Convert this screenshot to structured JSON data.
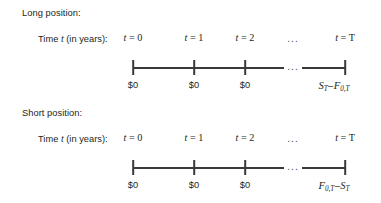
{
  "figure": {
    "background": "#ffffff",
    "ink_color": "#231f20",
    "rule_color": "#3a3a3a"
  },
  "blocks": [
    {
      "heading": "Long position:",
      "axis_label": "Time t (in years):",
      "axis_label_plain_prefix": "Time ",
      "axis_label_italic": "t",
      "axis_label_plain_suffix": " (in years):",
      "time_ticks": [
        {
          "var": "t",
          "eq": " = 0",
          "x": 133
        },
        {
          "var": "t",
          "eq": " = 1",
          "x": 194
        },
        {
          "var": "t",
          "eq": " = 2",
          "x": 245
        },
        {
          "var": "t",
          "eq": " = T",
          "x": 345
        }
      ],
      "time_ellipsis": {
        "text": "...",
        "x": 293
      },
      "axis": {
        "segments": [
          {
            "x1": 133,
            "x2": 284
          },
          {
            "x1": 302,
            "x2": 345
          }
        ],
        "ticks": [
          133,
          194,
          245,
          345
        ],
        "ellipsis": {
          "text": "...",
          "x": 293
        }
      },
      "cash_flows": [
        {
          "text": "$0",
          "x": 133,
          "type": "plain"
        },
        {
          "text": "$0",
          "x": 194,
          "type": "plain"
        },
        {
          "text": "$0",
          "x": 245,
          "type": "plain"
        },
        {
          "type": "math",
          "x": 334,
          "first_symbol": "S",
          "first_sub": "T",
          "operator": "–",
          "second_symbol": "F",
          "second_sub": "0,T",
          "text": "S_T – F_0,T"
        }
      ]
    },
    {
      "heading": "Short position:",
      "axis_label": "Time t (in years):",
      "axis_label_plain_prefix": "Time ",
      "axis_label_italic": "t",
      "axis_label_plain_suffix": " (in years):",
      "time_ticks": [
        {
          "var": "t",
          "eq": " = 0",
          "x": 133
        },
        {
          "var": "t",
          "eq": " = 1",
          "x": 194
        },
        {
          "var": "t",
          "eq": " = 2",
          "x": 245
        },
        {
          "var": "t",
          "eq": " = T",
          "x": 345
        }
      ],
      "time_ellipsis": {
        "text": "...",
        "x": 293
      },
      "axis": {
        "segments": [
          {
            "x1": 133,
            "x2": 284
          },
          {
            "x1": 302,
            "x2": 345
          }
        ],
        "ticks": [
          133,
          194,
          245,
          345
        ],
        "ellipsis": {
          "text": "...",
          "x": 293
        }
      },
      "cash_flows": [
        {
          "text": "$0",
          "x": 133,
          "type": "plain"
        },
        {
          "text": "$0",
          "x": 194,
          "type": "plain"
        },
        {
          "text": "$0",
          "x": 245,
          "type": "plain"
        },
        {
          "type": "math",
          "x": 334,
          "first_symbol": "F",
          "first_sub": "0,T",
          "operator": "–",
          "second_symbol": "S",
          "second_sub": "T",
          "text": "F_0,T – S_T"
        }
      ]
    }
  ]
}
